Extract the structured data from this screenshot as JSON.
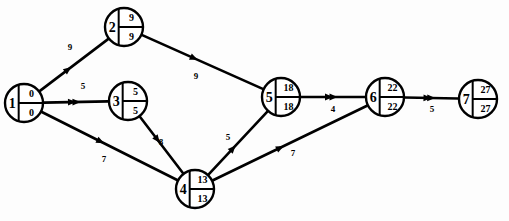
{
  "chart_data": {
    "type": "diagram",
    "diagram_kind": "activity-on-arrow-project-network",
    "title": "",
    "nodes": [
      {
        "id": "1",
        "label": "1",
        "early": "0",
        "late": "0",
        "x": 24,
        "y": 103,
        "r": 19
      },
      {
        "id": "2",
        "label": "2",
        "early": "9",
        "late": "9",
        "x": 124,
        "y": 27,
        "r": 19
      },
      {
        "id": "3",
        "label": "3",
        "early": "5",
        "late": "5",
        "x": 128,
        "y": 101,
        "r": 19
      },
      {
        "id": "4",
        "label": "4",
        "early": "13",
        "late": "13",
        "x": 195,
        "y": 189,
        "r": 19
      },
      {
        "id": "5",
        "label": "5",
        "early": "18",
        "late": "18",
        "x": 281,
        "y": 97,
        "r": 19
      },
      {
        "id": "6",
        "label": "6",
        "early": "22",
        "late": "22",
        "x": 385,
        "y": 97,
        "r": 19
      },
      {
        "id": "7",
        "label": "7",
        "early": "27",
        "late": "27",
        "x": 478,
        "y": 99,
        "r": 19
      }
    ],
    "edges": [
      {
        "from": "1",
        "to": "2",
        "label": "9",
        "label_x": 70,
        "label_y": 50,
        "double_arrow": false
      },
      {
        "from": "1",
        "to": "3",
        "label": "5",
        "label_x": 83,
        "label_y": 89,
        "double_arrow": true
      },
      {
        "from": "1",
        "to": "4",
        "label": "7",
        "label_x": 104,
        "label_y": 162,
        "double_arrow": false
      },
      {
        "from": "2",
        "to": "5",
        "label": "9",
        "label_x": 196,
        "label_y": 79,
        "double_arrow": false
      },
      {
        "from": "3",
        "to": "4",
        "label": "8",
        "label_x": 161,
        "label_y": 145,
        "double_arrow": false
      },
      {
        "from": "4",
        "to": "5",
        "label": "5",
        "label_x": 228,
        "label_y": 140,
        "double_arrow": false
      },
      {
        "from": "4",
        "to": "6",
        "label": "7",
        "label_x": 293,
        "label_y": 156,
        "double_arrow": false
      },
      {
        "from": "5",
        "to": "6",
        "label": "4",
        "label_x": 333,
        "label_y": 112,
        "double_arrow": true
      },
      {
        "from": "6",
        "to": "7",
        "label": "5",
        "label_x": 432,
        "label_y": 112,
        "double_arrow": true
      }
    ],
    "node_cell_meaning": {
      "top": "earliest event time",
      "bottom": "latest event time"
    },
    "colors": {
      "stroke": "#000000",
      "node_fill": "#ffffff",
      "background": "#ffffff"
    }
  }
}
